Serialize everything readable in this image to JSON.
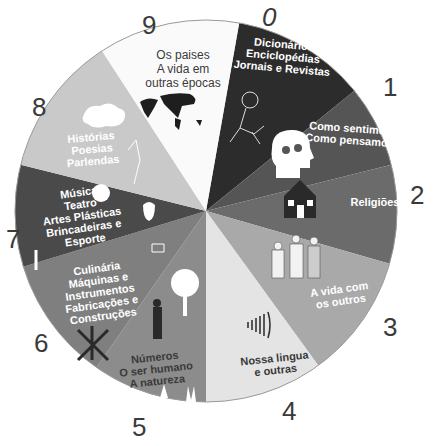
{
  "diagram": {
    "type": "circular-classification-wheel",
    "center": [
      206,
      211
    ],
    "radius": 191,
    "sectors": [
      {
        "number": "0",
        "label": "Dicionários\nEnciclopédias\nJornais e Revistas",
        "start_deg": 10,
        "end_deg": 51,
        "fill": "#2c2c2c",
        "text_color": "light",
        "icon": "reading-child-icon"
      },
      {
        "number": "1",
        "label": "Como sentimos\nComo pensamos",
        "start_deg": 51,
        "end_deg": 76,
        "fill": "#555555",
        "text_color": "light",
        "icon": "head-gears-icon"
      },
      {
        "number": "2",
        "label": "Religiões",
        "start_deg": 76,
        "end_deg": 106,
        "fill": "#6b6b6b",
        "text_color": "light",
        "icon": "church-icon"
      },
      {
        "number": "3",
        "label": "A vida com\nos outros",
        "start_deg": 106,
        "end_deg": 144,
        "fill": "#a9a9a9",
        "text_color": "light",
        "icon": "people-icon"
      },
      {
        "number": "4",
        "label": "Nossa lingua\ne outras",
        "start_deg": 144,
        "end_deg": 180,
        "fill": "#e4e4e4",
        "text_color": "dark",
        "icon": "sound-waves-icon"
      },
      {
        "number": "5",
        "label": "Números\nO ser humano\nA natureza",
        "start_deg": 180,
        "end_deg": 215,
        "fill": "#8c8c8c",
        "text_color": "dark",
        "icon": "tree-person-hands-icon"
      },
      {
        "number": "6",
        "label": "Culinária\nMáquinas e\nInstrumentos\nFabricações e\nConstruções",
        "start_deg": 215,
        "end_deg": 253,
        "fill": "#7f7f7f",
        "text_color": "light",
        "icon": "tools-icon"
      },
      {
        "number": "7",
        "label": "Música\nTeatro\nArtes Plásticas\nBrincadeiras e\nEsporte",
        "start_deg": 253,
        "end_deg": 284,
        "fill": "#4a4a4a",
        "text_color": "light",
        "icon": "masks-palette-icon"
      },
      {
        "number": "8",
        "label": "Histórias\nPoesias\nParlendas",
        "start_deg": 284,
        "end_deg": 327,
        "fill": "#c9c9c9",
        "text_color": "light",
        "icon": "cloud-dancer-icon"
      },
      {
        "number": "9",
        "label": "Os paises\nA vida em\noutras épocas",
        "start_deg": 327,
        "end_deg": 370,
        "fill": "#fafafa",
        "text_color": "dark",
        "icon": "world-map-icon"
      }
    ]
  }
}
